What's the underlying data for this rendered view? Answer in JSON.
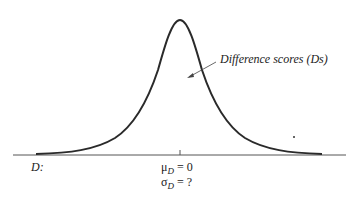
{
  "diagram": {
    "type": "normal-distribution-curve",
    "curve_label": "Difference scores (Ds)",
    "axis_variable": "D:",
    "mean_label": {
      "symbol": "μ",
      "subscript": "D",
      "rest": " = 0"
    },
    "sd_label": {
      "symbol": "σ",
      "subscript": "D",
      "rest": " = ?"
    },
    "colors": {
      "curve": "#2a2a2a",
      "axis": "#555555",
      "text": "#222222"
    }
  }
}
